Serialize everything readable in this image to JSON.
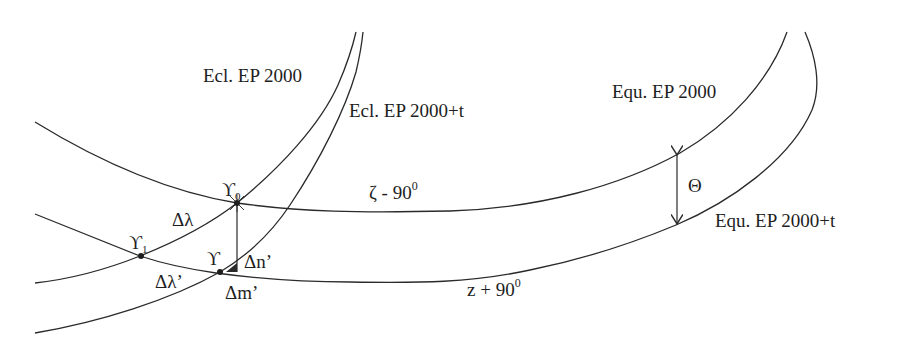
{
  "diagram": {
    "type": "precession-geometry",
    "curves": {
      "ecliptic_2000": {
        "label": "Ecl. EP 2000"
      },
      "ecliptic_2000t": {
        "label": "Ecl. EP 2000+t"
      },
      "equator_2000": {
        "label": "Equ. EP 2000"
      },
      "equator_2000t": {
        "label": "Equ. EP 2000+t"
      }
    },
    "points": {
      "aries0": {
        "symbol": "ϒ",
        "subscript": "0"
      },
      "aries1": {
        "symbol": "ϒ",
        "subscript": "1"
      },
      "aries": {
        "symbol": "ϒ"
      }
    },
    "annotations": {
      "delta_lambda": "Δλ",
      "delta_lambda_prime": "Δλ’",
      "delta_n_prime": "Δn’",
      "delta_m_prime": "Δm’",
      "zeta_label": "ζ - 90",
      "zeta_deg": "0",
      "z_label": "z + 90",
      "z_deg": "0",
      "theta": "Θ"
    },
    "colors": {
      "line": "#2a2a2a",
      "text": "#1e1e1e",
      "background": "#ffffff"
    }
  }
}
